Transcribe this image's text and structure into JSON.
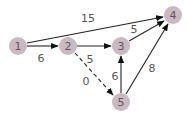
{
  "graph": {
    "nodes": [
      {
        "id": "1",
        "label": "1",
        "x": 18,
        "y": 46
      },
      {
        "id": "2",
        "label": "2",
        "x": 68,
        "y": 46
      },
      {
        "id": "3",
        "label": "3",
        "x": 121,
        "y": 46
      },
      {
        "id": "4",
        "label": "4",
        "x": 173,
        "y": 15
      },
      {
        "id": "5",
        "label": "5",
        "x": 121,
        "y": 102
      }
    ],
    "edges": [
      {
        "from": "1",
        "to": "4",
        "weight": "15",
        "style": "solid"
      },
      {
        "from": "1",
        "to": "2",
        "weight": "6",
        "style": "solid"
      },
      {
        "from": "2",
        "to": "3",
        "weight": "5",
        "style": "solid"
      },
      {
        "from": "3",
        "to": "4",
        "weight": "5",
        "style": "solid"
      },
      {
        "from": "2",
        "to": "5",
        "weight": "0",
        "style": "dashed"
      },
      {
        "from": "5",
        "to": "3",
        "weight": "6",
        "style": "solid"
      },
      {
        "from": "5",
        "to": "4",
        "weight": "8",
        "style": "solid"
      }
    ],
    "colors": {
      "node_fill": "#c9b9c1",
      "node_text": "#6a5060",
      "edge": "#222222",
      "label": "#555555"
    }
  }
}
